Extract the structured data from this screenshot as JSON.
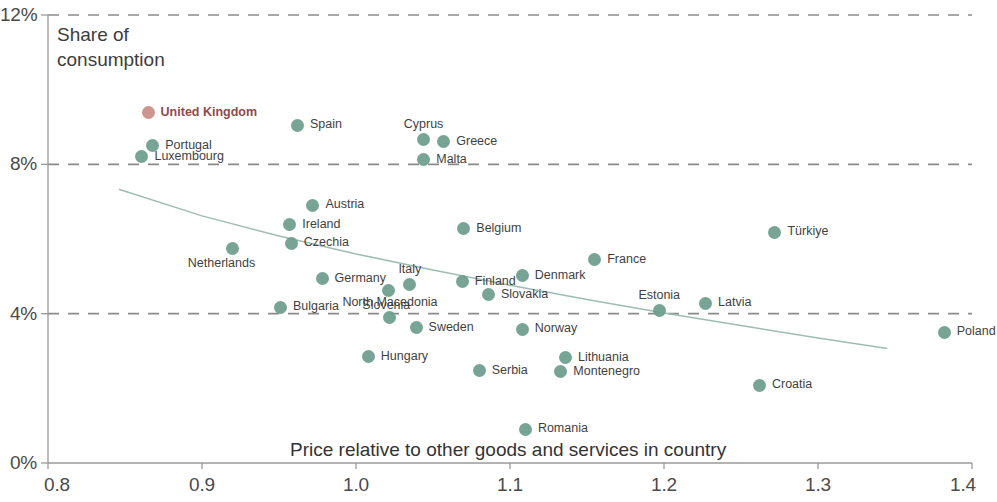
{
  "chart_data": {
    "type": "scatter",
    "title": "",
    "xlabel": "Price relative to other goods and services in country",
    "ylabel": "Share of consumption",
    "xlim": [
      0.8,
      1.4
    ],
    "ylim": [
      0.0,
      12.0
    ],
    "xticks": [
      "0.8",
      "0.9",
      "1.0",
      "1.1",
      "1.2",
      "1.3",
      "1.4"
    ],
    "yticks": [
      "0%",
      "4%",
      "8%",
      "12%"
    ],
    "grid": "horizontal-dashed",
    "legend": "none",
    "colors": {
      "marker": "#6d9d8d",
      "highlight_marker": "#c98d86",
      "highlight_label": "#8f4a4a",
      "gridline": "#8a8a8a",
      "axis": "#9a9a9a",
      "trendline": "#9dbdb4",
      "text": "#3f3f3f"
    },
    "trendline": {
      "present": true,
      "description": "downward sloping fitted curve",
      "points": [
        [
          0.846,
          7.33
        ],
        [
          0.9,
          6.62
        ],
        [
          0.95,
          6.08
        ],
        [
          1.0,
          5.6
        ],
        [
          1.05,
          5.17
        ],
        [
          1.1,
          4.76
        ],
        [
          1.15,
          4.38
        ],
        [
          1.2,
          4.02
        ],
        [
          1.25,
          3.68
        ],
        [
          1.3,
          3.35
        ],
        [
          1.345,
          3.07
        ]
      ]
    },
    "points": [
      {
        "name": "United Kingdom",
        "x": 0.865,
        "y": 9.38,
        "highlight": true,
        "label_pos": "right"
      },
      {
        "name": "Spain",
        "x": 0.962,
        "y": 9.05,
        "highlight": false,
        "label_pos": "right"
      },
      {
        "name": "Cyprus",
        "x": 1.044,
        "y": 8.67,
        "highlight": false,
        "label_pos": "above"
      },
      {
        "name": "Greece",
        "x": 1.057,
        "y": 8.6,
        "highlight": false,
        "label_pos": "right"
      },
      {
        "name": "Portugal",
        "x": 0.868,
        "y": 8.5,
        "highlight": false,
        "label_pos": "right"
      },
      {
        "name": "Luxembourg",
        "x": 0.861,
        "y": 8.2,
        "highlight": false,
        "label_pos": "right"
      },
      {
        "name": "Malta",
        "x": 1.044,
        "y": 8.12,
        "highlight": false,
        "label_pos": "right"
      },
      {
        "name": "Austria",
        "x": 0.972,
        "y": 6.9,
        "highlight": false,
        "label_pos": "right"
      },
      {
        "name": "Ireland",
        "x": 0.957,
        "y": 6.38,
        "highlight": false,
        "label_pos": "right"
      },
      {
        "name": "Czechia",
        "x": 0.958,
        "y": 5.88,
        "highlight": false,
        "label_pos": "right"
      },
      {
        "name": "Belgium",
        "x": 1.07,
        "y": 6.28,
        "highlight": false,
        "label_pos": "right"
      },
      {
        "name": "Türkiye",
        "x": 1.272,
        "y": 6.18,
        "highlight": false,
        "label_pos": "right"
      },
      {
        "name": "Netherlands",
        "x": 0.92,
        "y": 5.75,
        "highlight": false,
        "label_pos": "below-left"
      },
      {
        "name": "France",
        "x": 1.155,
        "y": 5.45,
        "highlight": false,
        "label_pos": "right"
      },
      {
        "name": "Denmark",
        "x": 1.108,
        "y": 5.02,
        "highlight": false,
        "label_pos": "right"
      },
      {
        "name": "Germany",
        "x": 0.978,
        "y": 4.93,
        "highlight": false,
        "label_pos": "right"
      },
      {
        "name": "Finland",
        "x": 1.069,
        "y": 4.85,
        "highlight": false,
        "label_pos": "right"
      },
      {
        "name": "Italy",
        "x": 1.035,
        "y": 4.77,
        "highlight": false,
        "label_pos": "above"
      },
      {
        "name": "Slovenia",
        "x": 1.021,
        "y": 4.63,
        "highlight": false,
        "label_pos": "below-left"
      },
      {
        "name": "Slovakia",
        "x": 1.086,
        "y": 4.51,
        "highlight": false,
        "label_pos": "right"
      },
      {
        "name": "Latvia",
        "x": 1.227,
        "y": 4.28,
        "highlight": false,
        "label_pos": "right"
      },
      {
        "name": "Bulgaria",
        "x": 0.951,
        "y": 4.17,
        "highlight": false,
        "label_pos": "right"
      },
      {
        "name": "Estonia",
        "x": 1.197,
        "y": 4.09,
        "highlight": false,
        "label_pos": "above"
      },
      {
        "name": "North Macedonia",
        "x": 1.022,
        "y": 3.9,
        "highlight": false,
        "label_pos": "above"
      },
      {
        "name": "Sweden",
        "x": 1.039,
        "y": 3.62,
        "highlight": false,
        "label_pos": "right"
      },
      {
        "name": "Norway",
        "x": 1.108,
        "y": 3.58,
        "highlight": false,
        "label_pos": "right"
      },
      {
        "name": "Poland",
        "x": 1.382,
        "y": 3.5,
        "highlight": false,
        "label_pos": "right"
      },
      {
        "name": "Hungary",
        "x": 1.008,
        "y": 2.85,
        "highlight": false,
        "label_pos": "right"
      },
      {
        "name": "Lithuania",
        "x": 1.136,
        "y": 2.82,
        "highlight": false,
        "label_pos": "right"
      },
      {
        "name": "Montenegro",
        "x": 1.133,
        "y": 2.45,
        "highlight": false,
        "label_pos": "right"
      },
      {
        "name": "Serbia",
        "x": 1.08,
        "y": 2.47,
        "highlight": false,
        "label_pos": "right"
      },
      {
        "name": "Croatia",
        "x": 1.262,
        "y": 2.08,
        "highlight": false,
        "label_pos": "right"
      },
      {
        "name": "Romania",
        "x": 1.11,
        "y": 0.9,
        "highlight": false,
        "label_pos": "right"
      }
    ]
  }
}
